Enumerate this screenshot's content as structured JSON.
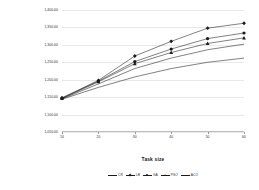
{
  "chart_data": {
    "type": "line",
    "title": "",
    "xlabel": "Task size",
    "ylabel": "Total system cost",
    "x": [
      10,
      20,
      30,
      40,
      50,
      60
    ],
    "xtick_labels": [
      "10",
      "20",
      "30",
      "40",
      "50",
      "60"
    ],
    "ytick_labels": [
      "1,400.00",
      "1,350.00",
      "1,300.00",
      "1,250.00",
      "1,200.00",
      "1,150.00",
      "1,100.00",
      "1,050.00"
    ],
    "ytick_values": [
      1400,
      1350,
      1300,
      1250,
      1200,
      1150,
      1100,
      1050
    ],
    "ylim": [
      1050,
      1400
    ],
    "xlim": [
      10,
      60
    ],
    "grid": true,
    "legend_position": "bottom",
    "series": [
      {
        "name": "S1",
        "marker": "diamond",
        "values": [
          1148,
          1198,
          1268,
          1310,
          1348,
          1362
        ]
      },
      {
        "name": "S2",
        "marker": "circle",
        "values": [
          1147,
          1196,
          1252,
          1288,
          1318,
          1334
        ]
      },
      {
        "name": "S3",
        "marker": "triangle",
        "values": [
          1146,
          1194,
          1246,
          1278,
          1304,
          1320
        ]
      },
      {
        "name": "S4",
        "marker": "none",
        "values": [
          1145,
          1188,
          1232,
          1262,
          1286,
          1302
        ]
      },
      {
        "name": "S5",
        "marker": "none",
        "values": [
          1144,
          1178,
          1208,
          1232,
          1250,
          1262
        ]
      }
    ],
    "legend_entries": [
      {
        "label": "CR",
        "marker": "none"
      },
      {
        "label": "LB",
        "marker": "diamond"
      },
      {
        "label": "GA",
        "marker": "circle"
      },
      {
        "label": "PSO",
        "marker": "triangle"
      },
      {
        "label": "ACO",
        "marker": "none"
      }
    ]
  }
}
